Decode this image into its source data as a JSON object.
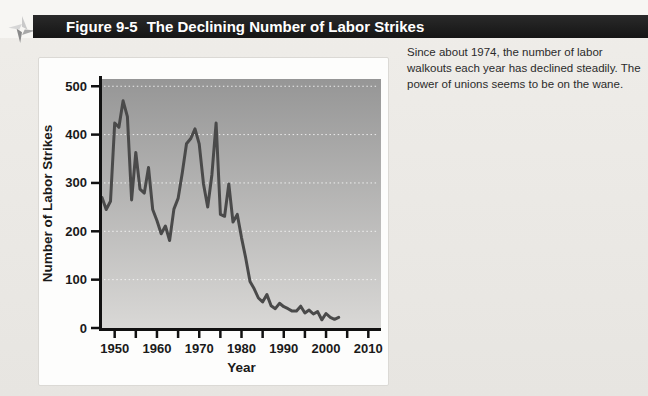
{
  "header": {
    "figure_label": "Figure 9-5",
    "figure_title": "The Declining Number of Labor Strikes"
  },
  "caption": {
    "text": "Since about 1974, the number of labor walkouts each year has declined steadily. The power of unions seems to be on the wane."
  },
  "icons": {
    "figure_pointer": "pinwheel-arrow-icon"
  },
  "colors": {
    "header_bar": "#1b1b1b",
    "header_text": "#ffffff",
    "line": "#4a4a4a",
    "plot_gradient_top": "#969696",
    "plot_gradient_bottom": "#d9d8d6",
    "gridline": "#ffffff",
    "axis": "#111111",
    "page_bg": "#e9e6e2",
    "card_bg": "#fdfdfc"
  },
  "chart_data": {
    "type": "line",
    "title": "",
    "xlabel": "Year",
    "ylabel": "Number of Labor Strikes",
    "xlim": [
      1947,
      2013
    ],
    "ylim": [
      0,
      515
    ],
    "grid": "dotted horizontal white lines at 100-unit intervals",
    "legend": "none",
    "x_ticks": [
      1950,
      1955,
      1960,
      1965,
      1970,
      1975,
      1980,
      1985,
      1990,
      1995,
      2000,
      2005,
      2010
    ],
    "x_tick_labels": [
      1950,
      1960,
      1970,
      1980,
      1990,
      2000,
      2010
    ],
    "y_ticks": [
      0,
      100,
      200,
      300,
      400,
      500
    ],
    "gridline_values": [
      100,
      200,
      300,
      400,
      500
    ],
    "series": [
      {
        "name": "Number of labor strikes per year",
        "x": [
          1947,
          1948,
          1949,
          1950,
          1951,
          1952,
          1953,
          1954,
          1955,
          1956,
          1957,
          1958,
          1959,
          1960,
          1961,
          1962,
          1963,
          1964,
          1965,
          1966,
          1967,
          1968,
          1969,
          1970,
          1971,
          1972,
          1973,
          1974,
          1975,
          1976,
          1977,
          1978,
          1979,
          1980,
          1981,
          1982,
          1983,
          1984,
          1985,
          1986,
          1987,
          1988,
          1989,
          1990,
          1991,
          1992,
          1993,
          1994,
          1995,
          1996,
          1997,
          1998,
          1999,
          2000,
          2001,
          2002,
          2003
        ],
        "values": [
          270,
          245,
          262,
          424,
          415,
          470,
          437,
          265,
          363,
          287,
          279,
          332,
          245,
          222,
          195,
          211,
          181,
          246,
          268,
          321,
          381,
          392,
          412,
          381,
          298,
          250,
          317,
          424,
          235,
          231,
          298,
          219,
          235,
          187,
          145,
          96,
          81,
          62,
          54,
          69,
          46,
          40,
          51,
          44,
          40,
          35,
          35,
          45,
          31,
          37,
          29,
          34,
          17,
          30,
          22,
          18,
          22
        ]
      }
    ],
    "line_color": "#4a4a4a",
    "line_width": 3,
    "plot_bg_gradient": [
      "#969696",
      "#d9d8d6"
    ]
  }
}
